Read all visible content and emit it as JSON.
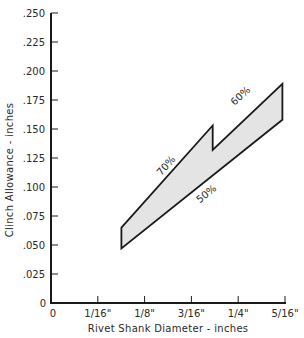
{
  "chart_data": {
    "type": "area",
    "title": "",
    "xlabel": "Rivet Shank Diameter - inches",
    "ylabel": "Clinch Allowance - inches",
    "xlim": [
      0,
      0.3125
    ],
    "ylim": [
      0,
      0.25
    ],
    "grid": false,
    "legend": "none",
    "x_ticks": [
      {
        "value": 0,
        "label": "0"
      },
      {
        "value": 0.0625,
        "label": "1/16\""
      },
      {
        "value": 0.125,
        "label": "1/8\""
      },
      {
        "value": 0.1875,
        "label": "3/16\""
      },
      {
        "value": 0.25,
        "label": "1/4\""
      },
      {
        "value": 0.3125,
        "label": "5/16\""
      }
    ],
    "y_ticks": [
      {
        "value": 0,
        "label": "0"
      },
      {
        "value": 0.025,
        "label": ".025"
      },
      {
        "value": 0.05,
        "label": ".050"
      },
      {
        "value": 0.075,
        "label": ".075"
      },
      {
        "value": 0.1,
        "label": ".100"
      },
      {
        "value": 0.125,
        "label": ".125"
      },
      {
        "value": 0.15,
        "label": ".150"
      },
      {
        "value": 0.175,
        "label": ".175"
      },
      {
        "value": 0.2,
        "label": ".200"
      },
      {
        "value": 0.225,
        "label": ".225"
      },
      {
        "value": 0.25,
        "label": ".250"
      }
    ],
    "series": [
      {
        "name": "70%",
        "x": [
          0.094,
          0.216
        ],
        "y": [
          0.065,
          0.153
        ]
      },
      {
        "name": "60%",
        "x": [
          0.216,
          0.309
        ],
        "y": [
          0.132,
          0.189
        ]
      },
      {
        "name": "50%",
        "x": [
          0.094,
          0.309
        ],
        "y": [
          0.047,
          0.158
        ]
      }
    ],
    "shaded_region": {
      "fill": "#e4e4e4",
      "vertices": [
        [
          0.094,
          0.047
        ],
        [
          0.094,
          0.065
        ],
        [
          0.216,
          0.153
        ],
        [
          0.216,
          0.132
        ],
        [
          0.309,
          0.189
        ],
        [
          0.309,
          0.158
        ]
      ]
    },
    "annotations": [
      {
        "text": "70%",
        "x": 0.165,
        "y": 0.113
      },
      {
        "text": "60%",
        "x": 0.26,
        "y": 0.173
      },
      {
        "text": "50%",
        "x": 0.205,
        "y": 0.096
      }
    ]
  },
  "colors": {
    "axis": "#1a1a1a",
    "fill": "#e4e4e4",
    "outline": "#1a1a1a"
  }
}
